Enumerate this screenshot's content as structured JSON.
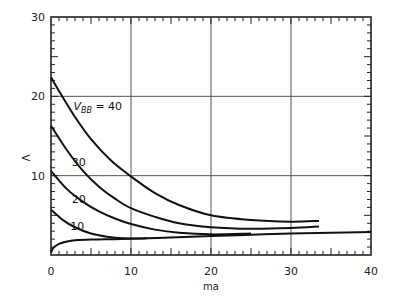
{
  "chart_data": {
    "type": "line",
    "title": "",
    "xlabel": "ma",
    "ylabel": "V",
    "xlim": [
      0,
      40
    ],
    "ylim": [
      0,
      30
    ],
    "xticks": [
      0,
      10,
      20,
      30,
      40
    ],
    "yticks": [
      10,
      20,
      30
    ],
    "xtick_labels": [
      "0",
      "10",
      "20",
      "30",
      "40"
    ],
    "ytick_labels": [
      "10",
      "20",
      "30"
    ],
    "x_minor_step": 1,
    "y_minor_step": 1,
    "grid": true,
    "legend": null,
    "annotations": [
      {
        "text": "V",
        "sub": "BB",
        "suffix": " = 40",
        "x": 2.8,
        "y": 18.3
      },
      {
        "text": "30",
        "x": 2.6,
        "y": 11.2
      },
      {
        "text": "20",
        "x": 2.6,
        "y": 6.6
      },
      {
        "text": "10",
        "x": 2.4,
        "y": 3.1
      }
    ],
    "series": [
      {
        "name": "V_BB = 40",
        "x": [
          0,
          1.4,
          3,
          5,
          7.5,
          10,
          13,
          16,
          20,
          25,
          30,
          33.5
        ],
        "y": [
          22.4,
          20,
          17.4,
          14.6,
          11.9,
          9.9,
          7.8,
          6.3,
          5.0,
          4.4,
          4.2,
          4.3
        ]
      },
      {
        "name": "V_BB = 30",
        "x": [
          0,
          2,
          4,
          6,
          8,
          10,
          13,
          16,
          20,
          25,
          30,
          33.5
        ],
        "y": [
          16.3,
          13.2,
          10.6,
          8.6,
          7.1,
          5.9,
          4.8,
          4.0,
          3.5,
          3.3,
          3.4,
          3.6
        ]
      },
      {
        "name": "V_BB = 20",
        "x": [
          0,
          2,
          4,
          6,
          8,
          10,
          13,
          16,
          20,
          25
        ],
        "y": [
          10.6,
          8.3,
          6.7,
          5.5,
          4.6,
          3.9,
          3.2,
          2.8,
          2.6,
          2.7
        ]
      },
      {
        "name": "V_BB = 10",
        "x": [
          0,
          1.5,
          3,
          5,
          7,
          9,
          12
        ],
        "y": [
          5.7,
          4.4,
          3.5,
          2.7,
          2.3,
          2.1,
          2.1
        ]
      },
      {
        "name": "bottom curve",
        "x": [
          0,
          0.3,
          1,
          2,
          3,
          5,
          8,
          10,
          15,
          20,
          25,
          30,
          35,
          40
        ],
        "y": [
          0.3,
          0.9,
          1.4,
          1.7,
          1.85,
          1.95,
          2.0,
          2.05,
          2.2,
          2.4,
          2.55,
          2.7,
          2.8,
          2.9
        ]
      }
    ]
  }
}
